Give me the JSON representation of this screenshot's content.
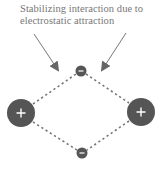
{
  "caption": {
    "line1": "Stabilizing interaction due to",
    "line2": "electrostatic attraction"
  },
  "colors": {
    "charge_fill": "#555555",
    "charge_symbol": "#ffffff",
    "dashed_line": "#777777",
    "arrow": "#666666",
    "text": "#777777",
    "background": "#ffffff"
  },
  "charges": [
    {
      "id": "cation-left",
      "sign": "+",
      "cx": 21,
      "cy": 113,
      "r": 14
    },
    {
      "id": "cation-right",
      "sign": "+",
      "cx": 141,
      "cy": 112,
      "r": 14
    },
    {
      "id": "anion-top",
      "sign": "-",
      "cx": 81,
      "cy": 71,
      "r": 5.5
    },
    {
      "id": "anion-bottom",
      "sign": "-",
      "cx": 82,
      "cy": 153,
      "r": 5.5
    }
  ],
  "interactions": [
    {
      "from": "cation-left",
      "to": "anion-top"
    },
    {
      "from": "anion-top",
      "to": "cation-right"
    },
    {
      "from": "cation-right",
      "to": "anion-bottom"
    },
    {
      "from": "anion-bottom",
      "to": "cation-left"
    }
  ],
  "arrows": [
    {
      "id": "arrow-left",
      "x1": 34,
      "y1": 34,
      "x2": 59,
      "y2": 72
    },
    {
      "id": "arrow-right",
      "x1": 126,
      "y1": 33,
      "x2": 101,
      "y2": 72
    }
  ]
}
